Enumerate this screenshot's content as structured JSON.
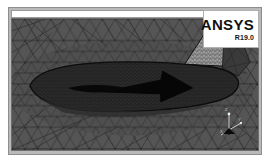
{
  "window": {
    "title": "ANSYS Mesh View",
    "frame_color": "#b9b9b9",
    "viewport_bg": "#4a4a4a"
  },
  "logo": {
    "brand": "ANSYS",
    "release": "R19.0",
    "plate_bg": "#ffffff",
    "text_color": "#111111"
  },
  "header_strip": {
    "label": ""
  },
  "axis_triad": {
    "name": "axis-triad",
    "x_label": "X",
    "y_label": "Y",
    "z_label": "Z"
  },
  "mesh": {
    "type": "unstructured-triangular-cfd-mesh",
    "description": "Unstructured triangular surface mesh around an aircraft fuselage cross-section with inflation boundary layer",
    "far_field_color": "#555555",
    "edge_color": "#2b2b2b",
    "body_color": "#0a0a0a",
    "inflation_color": "#1c1c1c",
    "fin_mesh_color": "#9a9a9a"
  }
}
